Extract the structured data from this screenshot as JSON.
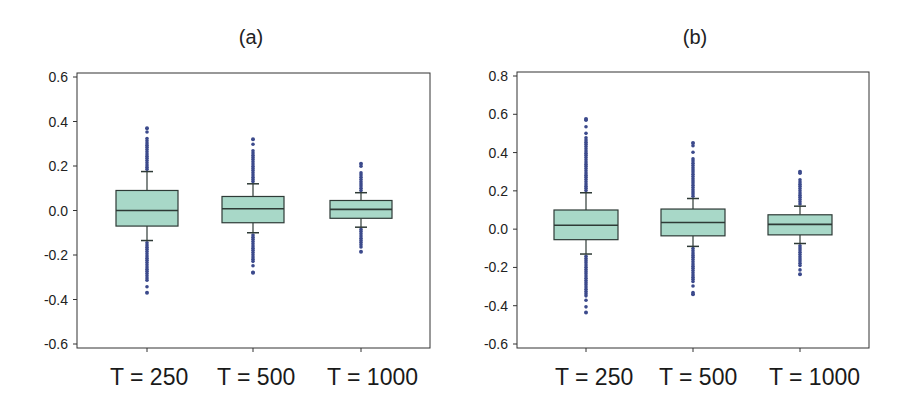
{
  "figure": {
    "panels": [
      {
        "id": "a",
        "title": "(a)"
      },
      {
        "id": "b",
        "title": "(b)"
      }
    ]
  },
  "colors": {
    "box_fill": "#a8d8c8",
    "box_stroke": "#2e3a36",
    "outlier": "#3c4a8c",
    "axis": "#333333"
  },
  "chart_data": [
    {
      "type": "boxplot",
      "title": "(a)",
      "xlabel": "",
      "ylabel": "",
      "categories": [
        "T = 250",
        "T = 500",
        "T = 1000"
      ],
      "ylim": [
        -0.6,
        0.6
      ],
      "yticks": [
        -0.6,
        -0.4,
        -0.2,
        0.0,
        0.2,
        0.4,
        0.6
      ],
      "ytick_labels": [
        "-0.6",
        "-0.4",
        "-0.2",
        "0.0",
        "0.2",
        "0.4",
        "0.6"
      ],
      "grid": false,
      "legend": null,
      "boxes": [
        {
          "label": "T = 250",
          "whisker_low": -0.135,
          "q1": -0.07,
          "median": 0.0,
          "q3": 0.09,
          "whisker_high": 0.175,
          "outlier_min": -0.37,
          "outlier_max": 0.37
        },
        {
          "label": "T = 500",
          "whisker_low": -0.1,
          "q1": -0.055,
          "median": 0.008,
          "q3": 0.063,
          "whisker_high": 0.12,
          "outlier_min": -0.28,
          "outlier_max": 0.32
        },
        {
          "label": "T = 1000",
          "whisker_low": -0.075,
          "q1": -0.035,
          "median": 0.005,
          "q3": 0.045,
          "whisker_high": 0.08,
          "outlier_min": -0.185,
          "outlier_max": 0.21
        }
      ]
    },
    {
      "type": "boxplot",
      "title": "(b)",
      "xlabel": "",
      "ylabel": "",
      "categories": [
        "T = 250",
        "T = 500",
        "T = 1000"
      ],
      "ylim": [
        -0.6,
        0.8
      ],
      "yticks": [
        -0.6,
        -0.4,
        -0.2,
        0.0,
        0.2,
        0.4,
        0.6,
        0.8
      ],
      "ytick_labels": [
        "-0.6",
        "-0.4",
        "-0.2",
        "0.0",
        "0.2",
        "0.4",
        "0.6",
        "0.8"
      ],
      "grid": false,
      "legend": null,
      "boxes": [
        {
          "label": "T = 250",
          "whisker_low": -0.13,
          "q1": -0.055,
          "median": 0.02,
          "q3": 0.1,
          "whisker_high": 0.19,
          "outlier_min": -0.435,
          "outlier_max": 0.575
        },
        {
          "label": "T = 500",
          "whisker_low": -0.09,
          "q1": -0.035,
          "median": 0.035,
          "q3": 0.105,
          "whisker_high": 0.16,
          "outlier_min": -0.34,
          "outlier_max": 0.45
        },
        {
          "label": "T = 1000",
          "whisker_low": -0.075,
          "q1": -0.03,
          "median": 0.025,
          "q3": 0.075,
          "whisker_high": 0.12,
          "outlier_min": -0.235,
          "outlier_max": 0.3
        }
      ]
    }
  ]
}
